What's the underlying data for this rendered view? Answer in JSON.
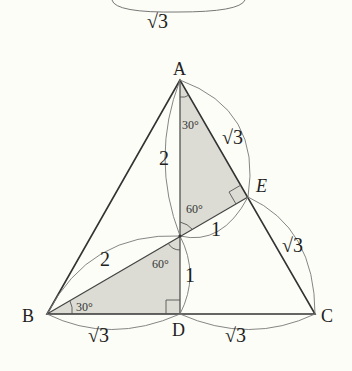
{
  "figure": {
    "type": "geometry-diagram",
    "colors": {
      "background": "#fdfdf8",
      "line": "#333333",
      "arc": "#777777",
      "shade": "#dcdcd4"
    },
    "top_partial": {
      "length_label": "√3"
    },
    "vertices": {
      "A": {
        "label": "A",
        "x": 180,
        "y": 80
      },
      "B": {
        "label": "B",
        "x": 47,
        "y": 314
      },
      "C": {
        "label": "C",
        "x": 315,
        "y": 314
      },
      "D": {
        "label": "D",
        "x": 180,
        "y": 314
      },
      "E": {
        "label": "E",
        "x": 248,
        "y": 197
      },
      "O": {
        "label": "",
        "x": 180,
        "y": 236
      }
    },
    "lengths": {
      "AO": "2",
      "AE": "√3",
      "OE": "1",
      "EC": "√3",
      "BO": "2",
      "OD": "1",
      "BD": "√3",
      "DC": "√3"
    },
    "angles": {
      "OAE": "30°",
      "AOE": "60°",
      "OBD": "30°",
      "BOD": "60°"
    },
    "right_angles": [
      "AEO",
      "ODB"
    ]
  }
}
